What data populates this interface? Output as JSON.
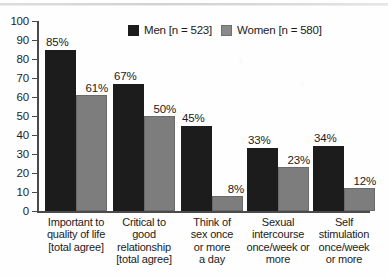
{
  "chart_data": {
    "type": "bar",
    "title": "",
    "xlabel": "",
    "ylabel": "",
    "ylim": [
      0,
      100
    ],
    "yticks": [
      0,
      10,
      20,
      30,
      40,
      50,
      60,
      70,
      80,
      90,
      100
    ],
    "grid": false,
    "legend_position": "top-center",
    "categories": [
      "Important to quality of life [total agree]",
      "Critical to good relationship [total agree]",
      "Think of sex once or more a day",
      "Sexual intercourse once/week or more",
      "Self stimulation once/week or more"
    ],
    "category_lines": [
      [
        "Important to",
        "quality of life",
        "[total agree]"
      ],
      [
        "Critical to",
        "good",
        "relationship",
        "[total agree]"
      ],
      [
        "Think of",
        "sex once",
        "or more",
        "a day"
      ],
      [
        "Sexual",
        "intercourse",
        "once/week or",
        "more"
      ],
      [
        "Self",
        "stimulation",
        "once/week",
        "or more"
      ]
    ],
    "series": [
      {
        "name": "Men [n = 523]",
        "color": "#1c1c1c",
        "values": [
          85,
          67,
          45,
          33,
          34
        ],
        "labels": [
          "85%",
          "67%",
          "45%",
          "33%",
          "34%"
        ]
      },
      {
        "name": "Women [n = 580]",
        "color": "#7d7d7d",
        "values": [
          61,
          50,
          8,
          23,
          12
        ],
        "labels": [
          "61%",
          "50%",
          "8%",
          "23%",
          "12%"
        ]
      }
    ]
  },
  "legend": {
    "items": [
      {
        "label": "Men [n = 523]",
        "swatch": "men-swatch"
      },
      {
        "label": "Women [n = 580]",
        "swatch": "women-swatch"
      }
    ]
  },
  "axis": {
    "y_tick_labels": [
      "100",
      "90",
      "80",
      "70",
      "60",
      "50",
      "40",
      "30",
      "20",
      "10",
      "0"
    ]
  }
}
